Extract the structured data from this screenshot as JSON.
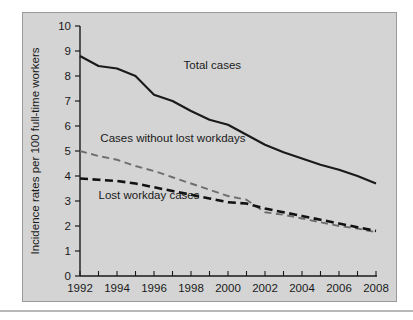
{
  "chart_data": {
    "type": "line",
    "title": "",
    "subtitle": "",
    "xlabel": "",
    "ylabel": "Incidence rates per 100 full-time workers",
    "xlim": [
      1992,
      2008
    ],
    "ylim": [
      0,
      10
    ],
    "y_ticks": [
      "0",
      "1",
      "2",
      "3",
      "4",
      "5",
      "6",
      "7",
      "8",
      "9",
      "10"
    ],
    "x_ticks": [
      "1992",
      "1994",
      "1996",
      "1998",
      "2000",
      "2002",
      "2004",
      "2006",
      "2008"
    ],
    "x_minor_ticks": [
      1993,
      1995,
      1997,
      1999,
      2001,
      2003,
      2005,
      2007
    ],
    "grid": false,
    "legend_position": "inline-annotations",
    "x": [
      1992,
      1993,
      1994,
      1995,
      1996,
      1997,
      1998,
      1999,
      2000,
      2001,
      2002,
      2003,
      2004,
      2005,
      2006,
      2007,
      2008
    ],
    "series": [
      {
        "name": "Total cases",
        "style": "solid",
        "color": "#1a1a1a",
        "values": [
          8.8,
          8.4,
          8.3,
          8.0,
          7.25,
          7.0,
          6.6,
          6.25,
          6.05,
          5.65,
          5.25,
          4.95,
          4.7,
          4.45,
          4.25,
          4.0,
          3.7
        ]
      },
      {
        "name": "Cases without lost workdays",
        "style": "dashed",
        "color": "#6e6e6e",
        "values": [
          5.0,
          4.8,
          4.65,
          4.4,
          4.2,
          3.95,
          3.7,
          3.45,
          3.2,
          3.05,
          2.55,
          2.45,
          2.3,
          2.15,
          2.0,
          1.9,
          1.75
        ]
      },
      {
        "name": "Lost workday cases",
        "style": "dashed",
        "color": "#111111",
        "values": [
          3.9,
          3.85,
          3.8,
          3.7,
          3.55,
          3.4,
          3.25,
          3.1,
          2.95,
          2.9,
          2.7,
          2.55,
          2.4,
          2.25,
          2.1,
          1.95,
          1.8
        ]
      }
    ],
    "annotations": [
      {
        "label": "Total cases",
        "x": 1997.6,
        "y": 8.3
      },
      {
        "label": "Cases without lost workdays",
        "x": 1993.1,
        "y": 5.35
      },
      {
        "label": "Lost workday cases",
        "x": 1993.0,
        "y": 3.1
      }
    ]
  },
  "axes": {
    "y_axis_title": "Incidence rates per 100 full-time workers"
  },
  "colors": {
    "panel_background": "#d4d4d4",
    "panel_border": "#9a9a9a",
    "axis": "#1a1a1a",
    "total_cases": "#1a1a1a",
    "cases_without_lost_workdays": "#6e6e6e",
    "lost_workday_cases": "#111111",
    "page_background": "#ffffff"
  }
}
